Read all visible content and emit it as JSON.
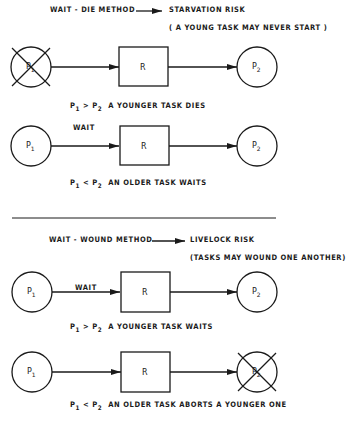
{
  "sections": [
    {
      "method": "WAIT - DIE METHOD",
      "risk": "STARVATION RISK",
      "risk_note": "( A YOUNG TASK MAY NEVER START )",
      "rows": [
        {
          "left": "P",
          "left_sub": "1",
          "left_crossed": true,
          "edge_label": "",
          "resource": "R",
          "right": "P",
          "right_sub": "2",
          "right_crossed": false,
          "caption_lhs": "P",
          "caption_lhs_sub": "1",
          "caption_op": ">",
          "caption_rhs": "P",
          "caption_rhs_sub": "2",
          "caption_text": "A YOUNGER TASK DIES"
        },
        {
          "left": "P",
          "left_sub": "1",
          "left_crossed": false,
          "edge_label": "WAIT",
          "resource": "R",
          "right": "P",
          "right_sub": "2",
          "right_crossed": false,
          "caption_lhs": "P",
          "caption_lhs_sub": "1",
          "caption_op": "<",
          "caption_rhs": "P",
          "caption_rhs_sub": "2",
          "caption_text": "AN OLDER TASK WAITS"
        }
      ]
    },
    {
      "method": "WAIT - WOUND METHOD",
      "risk": "LIVELOCK RISK",
      "risk_note": "(TASKS MAY WOUND ONE ANOTHER)",
      "rows": [
        {
          "left": "P",
          "left_sub": "1",
          "left_crossed": false,
          "edge_label": "WAIT",
          "resource": "R",
          "right": "P",
          "right_sub": "2",
          "right_crossed": false,
          "caption_lhs": "P",
          "caption_lhs_sub": "1",
          "caption_op": ">",
          "caption_rhs": "P",
          "caption_rhs_sub": "2",
          "caption_text": "A YOUNGER TASK WAITS"
        },
        {
          "left": "P",
          "left_sub": "1",
          "left_crossed": false,
          "edge_label": "",
          "resource": "R",
          "right": "P",
          "right_sub": "2",
          "right_crossed": true,
          "caption_lhs": "P",
          "caption_lhs_sub": "1",
          "caption_op": "<",
          "caption_rhs": "P",
          "caption_rhs_sub": "2",
          "caption_text": "AN OLDER TASK ABORTS A YOUNGER ONE"
        }
      ]
    }
  ]
}
